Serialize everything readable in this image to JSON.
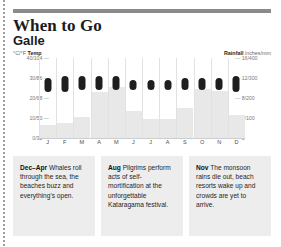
{
  "header": {
    "title": "When to Go",
    "subtitle": "Galle"
  },
  "legend": {
    "temp_units": "°C/°F",
    "temp_label": "Temp",
    "rain_label": "Rainfall",
    "rain_units": "inches/mm"
  },
  "chart_data": {
    "type": "bar",
    "xlabel": "",
    "ylabel": "°C/°F Temp",
    "y2label": "Rainfall inches/mm",
    "grid": false,
    "legend_position": "top",
    "categories": [
      "J",
      "F",
      "M",
      "A",
      "M",
      "J",
      "J",
      "A",
      "S",
      "O",
      "N",
      "D"
    ],
    "month_names": [
      "Jan",
      "Feb",
      "Mar",
      "Apr",
      "May",
      "Jun",
      "Jul",
      "Aug",
      "Sep",
      "Oct",
      "Nov",
      "Dec"
    ],
    "left_axis": {
      "label": "°C/°F Temp",
      "ticks": [
        "40/104",
        "30/86",
        "20/68",
        "10/50",
        "0/32"
      ],
      "tick_values_c": [
        40,
        30,
        20,
        10,
        0
      ],
      "tick_values_f": [
        104,
        86,
        68,
        50,
        32
      ],
      "ylim": [
        0,
        40
      ]
    },
    "right_axis": {
      "label": "Rainfall inches/mm",
      "ticks": [
        "16/400",
        "12/300",
        "8/200",
        "4/100",
        "0"
      ],
      "tick_values_in": [
        16,
        12,
        8,
        4,
        0
      ],
      "tick_values_mm": [
        400,
        300,
        200,
        100,
        0
      ],
      "ylim": [
        0,
        400
      ]
    },
    "series": [
      {
        "name": "Temp",
        "type": "range-capsule",
        "units": "°C",
        "color": "#1e1e1e",
        "low": [
          23,
          23,
          24,
          24,
          24,
          24,
          24,
          24,
          24,
          24,
          24,
          23
        ],
        "high": [
          30,
          31,
          31,
          31,
          31,
          29,
          29,
          29,
          30,
          30,
          30,
          31
        ]
      },
      {
        "name": "Rainfall",
        "type": "bar",
        "units": "mm",
        "color": "#e8e8e8",
        "values": [
          65,
          75,
          105,
          230,
          255,
          135,
          95,
          95,
          150,
          245,
          235,
          115
        ]
      }
    ]
  },
  "notes": [
    {
      "period": "Dec–Apr",
      "text": " Whales roll through the sea, the beaches buzz and everything's open."
    },
    {
      "period": "Aug",
      "text": " Pilgrims perform acts of self-mortification at the unforgettable Kataragama festival."
    },
    {
      "period": "Nov",
      "text": " The monsoon rains die out, beach resorts wake up and crowds are yet to arrive."
    }
  ]
}
